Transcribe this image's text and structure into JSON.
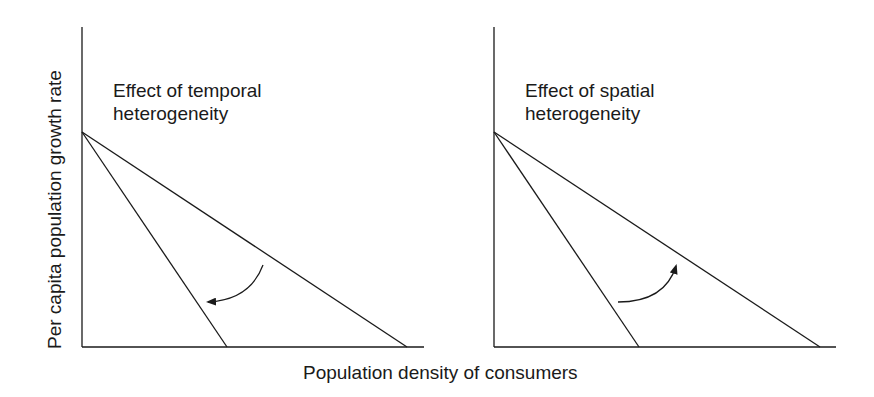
{
  "figure": {
    "y_axis_label": "Per capita population growth rate",
    "x_axis_label": "Population density of consumers",
    "panels": [
      {
        "id": "temporal",
        "title_line1": "Effect of temporal",
        "title_line2": "heterogeneity",
        "arrow_direction": "toward steeper line (lower carrying capacity)"
      },
      {
        "id": "spatial",
        "title_line1": "Effect of spatial",
        "title_line2": "heterogeneity",
        "arrow_direction": "toward shallower line (higher carrying capacity)"
      }
    ],
    "colors": {
      "line": "#1a1a1a",
      "background": "#ffffff"
    }
  }
}
